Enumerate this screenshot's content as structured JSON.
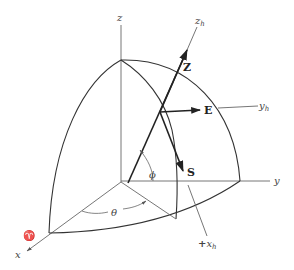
{
  "diagram": {
    "type": "spherical-coordinate-frame",
    "axes": {
      "z": "z",
      "y": "y",
      "x": "x",
      "zh": "z",
      "zh_sub": "h",
      "yh": "y",
      "yh_sub": "h",
      "xh_prefix": "+",
      "xh": "x",
      "xh_sub": "h"
    },
    "vectors": {
      "Z": "Z",
      "E": "E",
      "S": "S"
    },
    "angles": {
      "theta": "θ",
      "phi": "ϕ"
    },
    "symbols": {
      "aries": "♈"
    },
    "colors": {
      "line": "#333333",
      "thin_line": "#666666",
      "text": "#444444"
    }
  }
}
